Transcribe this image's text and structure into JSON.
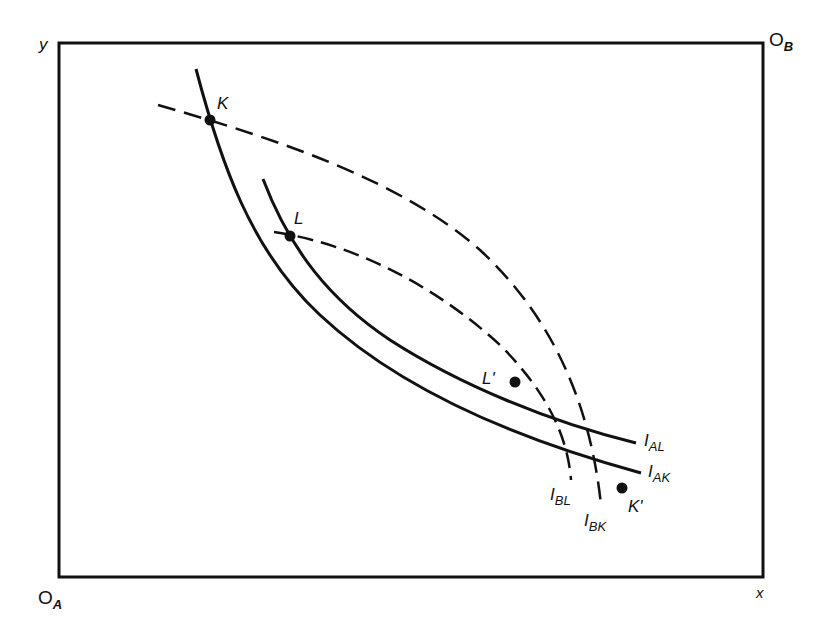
{
  "diagram": {
    "type": "edgeworth-box",
    "frame": {
      "left": 59,
      "top": 43,
      "right": 763,
      "bottom": 577,
      "stroke": "#111111"
    },
    "axes": {
      "y_label": "y",
      "x_label": "x",
      "origin_a": {
        "main": "O",
        "sub": "A"
      },
      "origin_b": {
        "main": "O",
        "sub": "B"
      }
    },
    "curves": [
      {
        "id": "I_AK",
        "label": {
          "main": "I",
          "sub": "AK"
        },
        "style": "solid",
        "owner": "A"
      },
      {
        "id": "I_AL",
        "label": {
          "main": "I",
          "sub": "AL"
        },
        "style": "solid",
        "owner": "A"
      },
      {
        "id": "I_BK",
        "label": {
          "main": "I",
          "sub": "BK"
        },
        "style": "dashed",
        "owner": "B"
      },
      {
        "id": "I_BL",
        "label": {
          "main": "I",
          "sub": "BL"
        },
        "style": "dashed",
        "owner": "B"
      }
    ],
    "points": [
      {
        "id": "K",
        "label": "K",
        "x": 210,
        "y": 120
      },
      {
        "id": "L",
        "label": "L",
        "x": 290,
        "y": 236
      },
      {
        "id": "L_prime",
        "label": "L'",
        "x": 515,
        "y": 382
      },
      {
        "id": "K_prime",
        "label": "K'",
        "x": 622,
        "y": 488
      }
    ],
    "colors": {
      "ink": "#111111",
      "background": "#ffffff"
    }
  }
}
